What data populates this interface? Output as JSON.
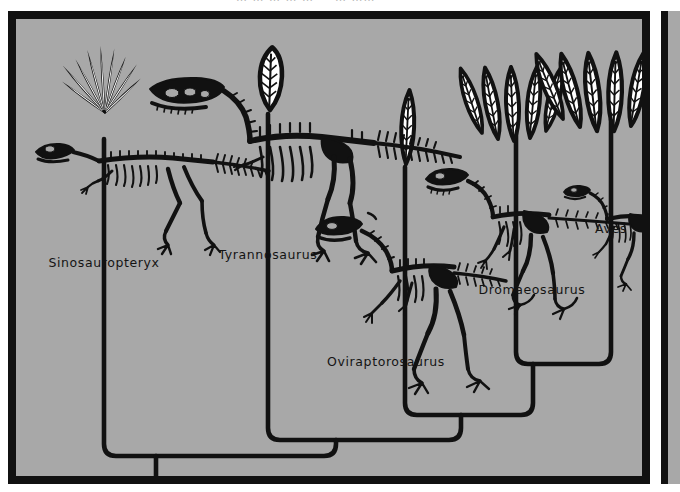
{
  "figure": {
    "kind": "cladogram",
    "background_color": "#a8a8a8",
    "ink_color": "#111111",
    "paper_color": "#ffffff"
  },
  "top_cut_text": "… … … … … — … ……",
  "taxa": [
    {
      "id": "sinosauropteryx",
      "label": "Sinosauropteryx",
      "branch_x": 88,
      "label_x": 88,
      "label_y": 248,
      "feather_type": "filamentous-tuft",
      "feather_count": 9,
      "split_y": 437
    },
    {
      "id": "tyrannosaurus",
      "label": "Tyrannosaurus",
      "branch_x": 252,
      "label_x": 252,
      "label_y": 240,
      "feather_type": "single-plumaceous-feather",
      "feather_count": 1,
      "split_y": 421
    },
    {
      "id": "oviraptorosaurus",
      "label": "Oviraptorosaurus",
      "branch_x": 389,
      "label_x": 370,
      "label_y": 347,
      "feather_type": "single-pennaceous-feather",
      "feather_count": 1,
      "split_y": 396
    },
    {
      "id": "dromaeosaurus",
      "label": "Dromaeosaurus",
      "branch_x": 500,
      "label_x": 516,
      "label_y": 275,
      "feather_type": "pennaceous-feather-cluster",
      "feather_count": 5,
      "split_y": 345
    },
    {
      "id": "aves",
      "label": "Aves",
      "branch_x": 595,
      "label_x": 595,
      "label_y": 214,
      "feather_type": "pennaceous-feather-fan",
      "feather_count": 6,
      "split_y": 345
    }
  ],
  "nodes": [
    {
      "id": "node-root",
      "x": 140,
      "y": 445,
      "children": [
        "sinosauropteryx",
        "node-tyr"
      ]
    },
    {
      "id": "node-tyr",
      "x": 320,
      "y": 429,
      "children": [
        "tyrannosaurus",
        "node-ovi"
      ]
    },
    {
      "id": "node-ovi",
      "x": 445,
      "y": 404,
      "children": [
        "oviraptorosaurus",
        "node-paraves"
      ]
    },
    {
      "id": "node-paraves",
      "x": 517,
      "y": 353,
      "children": [
        "dromaeosaurus",
        "aves"
      ]
    }
  ],
  "root_stem": {
    "x": 140,
    "y_top": 445,
    "y_bottom": 457
  }
}
